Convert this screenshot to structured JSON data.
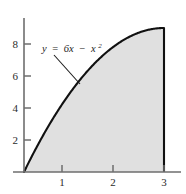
{
  "figure": {
    "label": "graph-of-y-equals-6x-minus-x-squared",
    "background_color": "#ffffff"
  },
  "annotation": {
    "equation_text": "y = 6x − x²",
    "parts": {
      "y": "y",
      "equals": "=",
      "six_x": "6x",
      "minus": "−",
      "x": "x",
      "exponent": "2"
    },
    "leader_line": "leader-line-to-curve"
  },
  "chart_data": {
    "type": "area",
    "title": "",
    "subtitle": "",
    "xlabel": "",
    "ylabel": "",
    "equation": "y = 6x - x^2",
    "legend": [],
    "legend_position": "none",
    "grid": false,
    "xlim": [
      0,
      3.35
    ],
    "ylim": [
      0,
      10.3
    ],
    "xticks": [
      1,
      2,
      3
    ],
    "xtick_labels": [
      "1",
      "2",
      "3"
    ],
    "yticks": [
      2,
      4,
      6,
      8
    ],
    "ytick_labels": [
      "2",
      "4",
      "6",
      "8"
    ],
    "shaded_region": {
      "from_x": 0,
      "to_x": 3,
      "fill_color": "#e0e0e0",
      "description": "area-under-curve-from-0-to-3"
    },
    "series": [
      {
        "name": "y = 6x - x^2",
        "color": "#111111",
        "x": [
          0,
          0.25,
          0.5,
          0.75,
          1,
          1.25,
          1.5,
          1.75,
          2,
          2.25,
          2.5,
          2.75,
          3
        ],
        "values": [
          0,
          1.4375,
          2.75,
          3.9375,
          5,
          5.9375,
          6.75,
          7.4375,
          8,
          8.4375,
          8.75,
          8.9375,
          9
        ]
      }
    ],
    "axis_color": "#6e6e6e",
    "curve_color": "#111111"
  }
}
